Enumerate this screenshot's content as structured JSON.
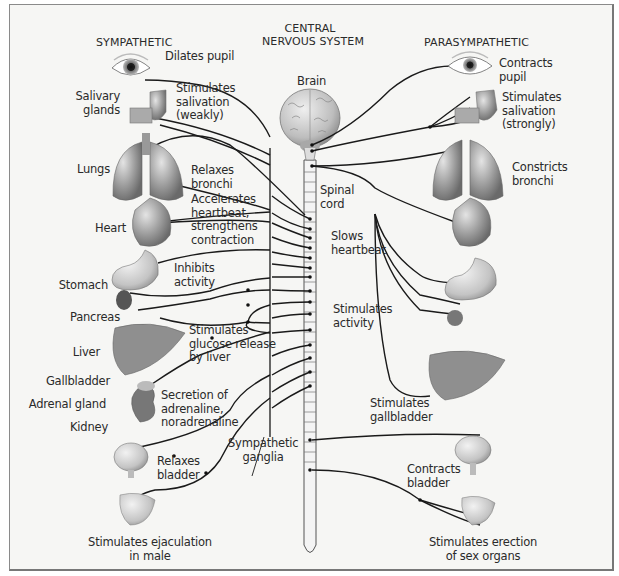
{
  "headers": {
    "sympathetic": "SYMPATHETIC",
    "cns_line1": "CENTRAL",
    "cns_line2": "NERVOUS SYSTEM",
    "parasympathetic": "PARASYMPATHETIC"
  },
  "center_labels": {
    "brain": "Brain",
    "spinal_cord": "Spinal\ncord",
    "sympathetic_ganglia": "Sympathetic\nganglia"
  },
  "sympathetic": {
    "organ_labels": {
      "salivary_glands": "Salivary\nglands",
      "lungs": "Lungs",
      "heart": "Heart",
      "stomach": "Stomach",
      "pancreas": "Pancreas",
      "liver": "Liver",
      "gallbladder": "Gallbladder",
      "adrenal_gland": "Adrenal gland",
      "kidney": "Kidney"
    },
    "effects": {
      "eye": "Dilates pupil",
      "salivary": "Stimulates\nsalivation\n(weakly)",
      "lungs": "Relaxes\nbronchi",
      "heart": "Accelerates\nheartbeat,\nstrengthens\ncontraction",
      "stomach": "Inhibits\nactivity",
      "liver": "Stimulates\nglucose release\nby liver",
      "adrenal": "Secretion of\nadrenaline,\nnoradrenaline",
      "bladder": "Relaxes\nbladder",
      "sex": "Stimulates ejaculation\nin male"
    }
  },
  "parasympathetic": {
    "effects": {
      "eye": "Contracts\npupil",
      "salivary": "Stimulates\nsalivation\n(strongly)",
      "lungs": "Constricts\nbronchi",
      "heart": "Slows\nheartbeat",
      "stomach": "Stimulates\nactivity",
      "gallbladder": "Stimulates\ngallbladder",
      "bladder": "Contracts\nbladder",
      "sex": "Stimulates erection\nof sex organs"
    }
  },
  "colors": {
    "background": "#f6f6f4",
    "nerve": "#1a1a1a",
    "organ_gray": "#8c8c8c",
    "text": "#2a2a2a"
  }
}
